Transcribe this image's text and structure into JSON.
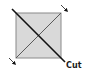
{
  "diagram": {
    "square": {
      "x": 16,
      "y": 13,
      "width": 45,
      "height": 45,
      "fill": "#d9d9d9",
      "stroke": "#8a8a8a"
    },
    "fold_diagonal": {
      "from": [
        16,
        58
      ],
      "to": [
        61,
        13
      ],
      "stroke": "#5a5a5a"
    },
    "cut_line": {
      "from": [
        12,
        9
      ],
      "to": [
        65,
        62
      ],
      "stroke": "#111111"
    },
    "arrows": [
      {
        "position": "top-right",
        "direction": "down-right",
        "from": [
          61,
          5
        ],
        "to": [
          68,
          12
        ]
      },
      {
        "position": "bottom-left",
        "direction": "down-right",
        "from": [
          9,
          58
        ],
        "to": [
          16,
          65
        ]
      }
    ],
    "labels": {
      "cut": "Cut"
    }
  }
}
